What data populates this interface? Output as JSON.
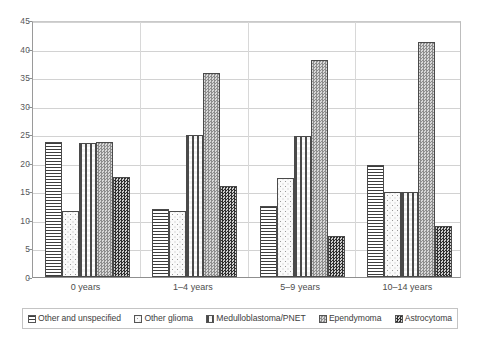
{
  "chart_data": {
    "type": "bar",
    "title": "",
    "xlabel": "",
    "ylabel": "",
    "ylim": [
      0,
      45
    ],
    "ytick_step": 5,
    "yticks": [
      "0",
      "5",
      "10",
      "15",
      "20",
      "25",
      "30",
      "35",
      "40",
      "45"
    ],
    "grid": true,
    "legend_position": "bottom",
    "categories": [
      "0 years",
      "1–4 years",
      "5–9 years",
      "10–14 years"
    ],
    "series": [
      {
        "name": "Other and unspecified",
        "pattern": "horizontal-lines",
        "values": [
          23.7,
          11.9,
          12.4,
          19.7
        ]
      },
      {
        "name": "Other glioma",
        "pattern": "light-dots",
        "values": [
          11.6,
          11.5,
          17.3,
          14.9
        ]
      },
      {
        "name": "Medulloblastoma/PNET",
        "pattern": "medium-dots",
        "values": [
          23.4,
          24.9,
          24.7,
          14.9
        ]
      },
      {
        "name": "Ependymoma",
        "pattern": "fine-stipple",
        "values": [
          23.7,
          35.8,
          38.0,
          41.2
        ]
      },
      {
        "name": "Astrocytoma",
        "pattern": "dark-checker",
        "values": [
          17.6,
          15.9,
          7.2,
          9.0
        ]
      }
    ]
  }
}
